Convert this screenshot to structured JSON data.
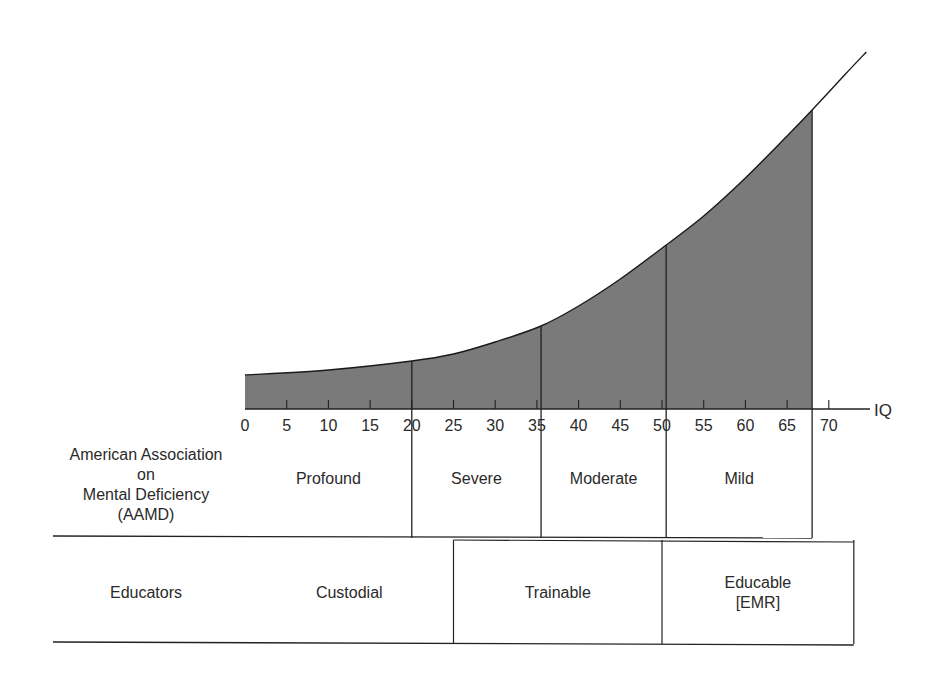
{
  "chart_data": {
    "type": "area",
    "title": "",
    "xlabel": "IQ",
    "ylabel": "",
    "x_ticks": [
      0,
      5,
      10,
      15,
      20,
      25,
      30,
      35,
      40,
      45,
      50,
      55,
      60,
      65,
      70
    ],
    "xlim": [
      0,
      75
    ],
    "grid": false,
    "shaded_range": [
      0,
      68
    ],
    "curve_points": [
      {
        "iq": 0,
        "height": 34
      },
      {
        "iq": 10,
        "height": 39
      },
      {
        "iq": 20,
        "height": 48
      },
      {
        "iq": 25,
        "height": 55
      },
      {
        "iq": 30,
        "height": 67
      },
      {
        "iq": 35.5,
        "height": 83
      },
      {
        "iq": 40,
        "height": 103
      },
      {
        "iq": 45,
        "height": 130
      },
      {
        "iq": 50.5,
        "height": 164
      },
      {
        "iq": 55,
        "height": 193
      },
      {
        "iq": 60,
        "height": 231
      },
      {
        "iq": 65,
        "height": 273
      },
      {
        "iq": 68,
        "height": 299
      },
      {
        "iq": 72,
        "height": 335
      },
      {
        "iq": 74.5,
        "height": 357
      }
    ],
    "dividers_iq": [
      20,
      35.5,
      50.5,
      68
    ],
    "fill_color": "#7a7a7a",
    "line_color": "#1a1a1a"
  },
  "axis": {
    "label": "IQ",
    "tick_labels": [
      "0",
      "5",
      "10",
      "15",
      "20",
      "25",
      "30",
      "35",
      "40",
      "45",
      "50",
      "55",
      "60",
      "65",
      "70"
    ]
  },
  "classification_table": {
    "rows": [
      {
        "label_lines": [
          "American Association",
          "on",
          "Mental Deficiency",
          "(AAMD)"
        ],
        "cells": [
          {
            "label_lines": [
              "Profound"
            ],
            "range": [
              0,
              20
            ]
          },
          {
            "label_lines": [
              "Severe"
            ],
            "range": [
              20,
              35.5
            ]
          },
          {
            "label_lines": [
              "Moderate"
            ],
            "range": [
              35.5,
              50.5
            ]
          },
          {
            "label_lines": [
              "Mild"
            ],
            "range": [
              50.5,
              68
            ]
          }
        ]
      },
      {
        "label_lines": [
          "Educators"
        ],
        "cells": [
          {
            "label_lines": [
              "Custodial"
            ],
            "range": [
              0,
              25
            ]
          },
          {
            "label_lines": [
              "Trainable"
            ],
            "range": [
              25,
              50
            ]
          },
          {
            "label_lines": [
              "Educable",
              "[EMR]"
            ],
            "range": [
              50,
              73
            ]
          }
        ]
      }
    ]
  }
}
